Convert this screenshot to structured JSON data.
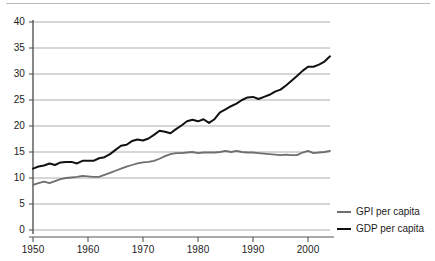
{
  "chart_data": {
    "type": "line",
    "title": "",
    "subtitle": "",
    "xlabel": "",
    "ylabel": "",
    "xlim": [
      1950,
      2004
    ],
    "ylim": [
      0,
      40
    ],
    "grid": true,
    "grid_axis": "y",
    "legend_position": "right-bottom",
    "xticks": [
      "1950",
      "1960",
      "1970",
      "1980",
      "1990",
      "2000"
    ],
    "xtick_values": [
      1950,
      1960,
      1970,
      1980,
      1990,
      2000
    ],
    "yticks": [
      "0",
      "5",
      "10",
      "15",
      "20",
      "25",
      "30",
      "35",
      "40"
    ],
    "ytick_values": [
      0,
      5,
      10,
      15,
      20,
      25,
      30,
      35,
      40
    ],
    "x": [
      1950,
      1951,
      1952,
      1953,
      1954,
      1955,
      1956,
      1957,
      1958,
      1959,
      1960,
      1961,
      1962,
      1963,
      1964,
      1965,
      1966,
      1967,
      1968,
      1969,
      1970,
      1971,
      1972,
      1973,
      1974,
      1975,
      1976,
      1977,
      1978,
      1979,
      1980,
      1981,
      1982,
      1983,
      1984,
      1985,
      1986,
      1987,
      1988,
      1989,
      1990,
      1991,
      1992,
      1993,
      1994,
      1995,
      1996,
      1997,
      1998,
      1999,
      2000,
      2001,
      2002,
      2003,
      2004
    ],
    "series": [
      {
        "name": "GPI per capita",
        "color": "#6f6f6f",
        "values": [
          8.7,
          9.0,
          9.3,
          9.0,
          9.4,
          9.8,
          10.0,
          10.1,
          10.2,
          10.4,
          10.3,
          10.2,
          10.2,
          10.6,
          11.0,
          11.4,
          11.8,
          12.2,
          12.5,
          12.8,
          13.0,
          13.1,
          13.3,
          13.7,
          14.2,
          14.6,
          14.8,
          14.8,
          14.9,
          15.0,
          14.8,
          14.9,
          14.9,
          14.9,
          15.0,
          15.2,
          15.0,
          15.2,
          15.0,
          14.9,
          14.9,
          14.8,
          14.7,
          14.6,
          14.5,
          14.4,
          14.5,
          14.4,
          14.4,
          14.9,
          15.2,
          14.8,
          14.9,
          15.0,
          15.2
        ]
      },
      {
        "name": "GDP per capita",
        "color": "#111111",
        "values": [
          11.8,
          12.2,
          12.4,
          12.8,
          12.5,
          13.0,
          13.1,
          13.1,
          12.8,
          13.3,
          13.3,
          13.3,
          13.8,
          14.0,
          14.6,
          15.4,
          16.2,
          16.4,
          17.1,
          17.4,
          17.2,
          17.6,
          18.3,
          19.1,
          18.9,
          18.6,
          19.4,
          20.1,
          20.9,
          21.2,
          20.9,
          21.3,
          20.6,
          21.3,
          22.6,
          23.2,
          23.8,
          24.3,
          25.0,
          25.5,
          25.6,
          25.2,
          25.6,
          26.0,
          26.6,
          27.0,
          27.8,
          28.7,
          29.6,
          30.6,
          31.4,
          31.4,
          31.8,
          32.4,
          33.4
        ]
      }
    ],
    "legend": [
      {
        "label": "GPI per capita",
        "color": "#6f6f6f"
      },
      {
        "label": "GDP per capita",
        "color": "#111111"
      }
    ]
  },
  "axis": {
    "y_labels": [
      "40",
      "35",
      "30",
      "25",
      "20",
      "15",
      "10",
      "5",
      "0"
    ],
    "x_labels": [
      "1950",
      "1960",
      "1970",
      "1980",
      "1990",
      "2000"
    ]
  },
  "legend": {
    "items": [
      {
        "label": "GPI per capita"
      },
      {
        "label": "GDP per capita"
      }
    ]
  },
  "colors": {
    "gpi_line": "#6f6f6f",
    "gdp_line": "#111111",
    "gridline": "#9a9a9a",
    "axis": "#555555",
    "top_rule": "#b9b9b9",
    "background": "#ffffff"
  }
}
